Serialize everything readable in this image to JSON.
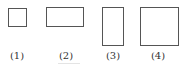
{
  "figure": {
    "stroke_color": "#555555",
    "label_color": "#333333",
    "shapes": [
      {
        "id": 1,
        "kind": "square",
        "label": "(1)"
      },
      {
        "id": 2,
        "kind": "wide-rectangle",
        "label": "(2)"
      },
      {
        "id": 3,
        "kind": "tall-rectangle",
        "label": "(3)"
      },
      {
        "id": 4,
        "kind": "large-rectangle",
        "label": "(4)"
      }
    ]
  }
}
